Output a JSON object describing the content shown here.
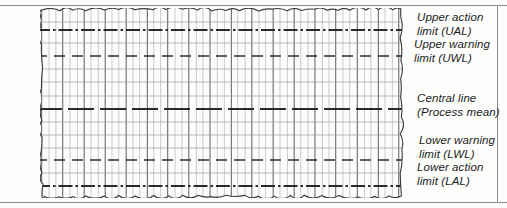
{
  "figure": {
    "kind": "statistical-process-control-chart"
  },
  "labels": {
    "ual": {
      "line1": "Upper action",
      "line2": "limit (UAL)"
    },
    "uwl": {
      "line1": "Upper warning",
      "line2": "limit (UWL)"
    },
    "central": {
      "line1": "Central line",
      "line2": "(Process mean)"
    },
    "lwl": {
      "line1": "Lower warning",
      "line2": "limit (LWL)"
    },
    "lal": {
      "line1": "Lower action",
      "line2": "limit (LAL)"
    }
  },
  "chart_data": {
    "type": "line",
    "title": "",
    "xlabel": "",
    "ylabel": "",
    "grid": true,
    "legend_position": "right",
    "x": [
      0,
      1
    ],
    "axis_ranges": {
      "xlim": [
        0,
        1
      ],
      "ylim": [
        0,
        1
      ]
    },
    "control_lines": [
      {
        "name": "Upper action limit (UAL)",
        "abbr": "UAL",
        "y_px": 22,
        "style": "dash-dot",
        "weight": "heavy"
      },
      {
        "name": "Upper warning limit (UWL)",
        "abbr": "UWL",
        "y_px": 48,
        "style": "dashed",
        "weight": "medium"
      },
      {
        "name": "Central line (Process mean)",
        "abbr": "CL",
        "y_px": 101,
        "style": "long-dash",
        "weight": "heavy"
      },
      {
        "name": "Lower warning limit (LWL)",
        "abbr": "LWL",
        "y_px": 152,
        "style": "dashed",
        "weight": "medium"
      },
      {
        "name": "Lower action limit (LAL)",
        "abbr": "LAL",
        "y_px": 178,
        "style": "dash-dot",
        "weight": "heavy"
      }
    ],
    "minor_horizontal_gridlines_y_px": [
      14,
      35,
      61,
      74,
      88,
      114,
      127,
      140,
      165,
      190
    ],
    "vertical_gridline_spacing_px": 7,
    "vertical_major_every": 3,
    "colors": {
      "paper": "#fdfdfb",
      "grid_minor": "#9a9a9a",
      "grid_major": "#6b6b6b",
      "control_line": "#202020",
      "torn_edge": "#3a3a3a",
      "label_text": "#1b1b1b",
      "frame_rule": "#8d8d8d"
    }
  }
}
